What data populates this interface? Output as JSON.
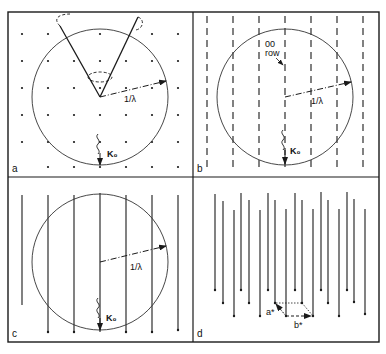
{
  "figure": {
    "panels": [
      {
        "id": "a",
        "label": "a",
        "radius_label": "1/λ",
        "beam_label": "K₀",
        "description": "Reciprocal lattice points with Ewald sphere and diffraction cone"
      },
      {
        "id": "b",
        "label": "b",
        "radius_label": "1/λ",
        "beam_label": "K₀",
        "row_label_line1": "00",
        "row_label_line2": "row",
        "description": "Dashed reciprocal lattice rods with Ewald sphere"
      },
      {
        "id": "c",
        "label": "c",
        "radius_label": "1/λ",
        "beam_label": "K₀",
        "description": "Continuous reciprocal lattice rods with Ewald sphere"
      },
      {
        "id": "d",
        "label": "d",
        "vector_a_label": "a*",
        "vector_b_label": "b*",
        "description": "Perspective view of reciprocal lattice rods with a* and b* vectors"
      }
    ]
  },
  "colors": {
    "ink": "#1a1a1a",
    "background": "#ffffff"
  }
}
